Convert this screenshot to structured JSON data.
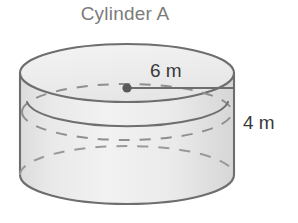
{
  "figure": {
    "title": "Cylinder A",
    "shape": "cylinder",
    "title_color": "#7b7b7b",
    "labels": {
      "radius": "6 m",
      "height": "4 m"
    },
    "colors": {
      "outline": "#6e6e6e",
      "top_face_fill": "#efefef",
      "body_fill": "#e6e6e6",
      "hidden_edge": "#8f8f8f",
      "dimension_text": "#3a3a3a",
      "background": "#ffffff"
    },
    "geometry": {
      "left_x": 22,
      "right_x": 237,
      "top_ellipse_cy": 73,
      "bottom_ellipse_cy": 175,
      "ellipse_rx": 107,
      "ellipse_ry": 29,
      "center_dot": [
        127,
        88
      ]
    }
  }
}
